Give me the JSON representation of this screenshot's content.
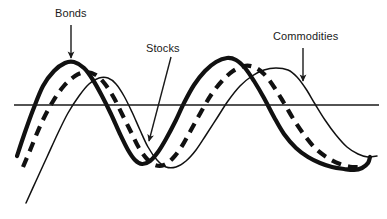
{
  "figure": {
    "background_color": "#ffffff",
    "line_color": "#111111",
    "axis_color": "#1a1a1a"
  },
  "annotations": [
    {
      "id": "bonds",
      "label": "Bonds",
      "points_to_series": "Bonds",
      "arrow": {
        "x1": 71,
        "y1": 25,
        "x2": 71,
        "y2": 58
      }
    },
    {
      "id": "stocks",
      "label": "Stocks",
      "points_to_series": "Stocks",
      "arrow": {
        "x1": 171,
        "y1": 57,
        "x2": 149,
        "y2": 141
      }
    },
    {
      "id": "commodities",
      "label": "Commodities",
      "points_to_series": "Commodities",
      "arrow": {
        "x1": 303,
        "y1": 48,
        "x2": 303,
        "y2": 81
      }
    }
  ],
  "chart_data": {
    "type": "line",
    "title": "",
    "xlabel": "",
    "ylabel": "",
    "grid": false,
    "legend_position": "inline-annotations",
    "axis": {
      "zero_line": true,
      "zero_line_y": 105,
      "zero_line_x_start": 14,
      "zero_line_x_end": 379,
      "xlim": [
        0,
        387
      ],
      "ylim": [
        219,
        0
      ]
    },
    "series": [
      {
        "name": "Bonds",
        "style": "thick-solid",
        "stroke_width": 4.2,
        "dash": "none",
        "color": "#111111",
        "phase_note": "leads — peaks first",
        "points": [
          [
            17,
            156
          ],
          [
            24,
            135
          ],
          [
            33,
            110
          ],
          [
            43,
            86
          ],
          [
            54,
            71
          ],
          [
            65,
            63
          ],
          [
            74,
            62
          ],
          [
            84,
            68
          ],
          [
            93,
            80
          ],
          [
            102,
            96
          ],
          [
            111,
            114
          ],
          [
            120,
            134
          ],
          [
            128,
            150
          ],
          [
            135,
            160
          ],
          [
            142,
            164
          ],
          [
            150,
            161
          ],
          [
            158,
            152
          ],
          [
            166,
            139
          ],
          [
            175,
            122
          ],
          [
            184,
            103
          ],
          [
            194,
            85
          ],
          [
            205,
            71
          ],
          [
            216,
            62
          ],
          [
            227,
            58
          ],
          [
            236,
            60
          ],
          [
            245,
            68
          ],
          [
            254,
            81
          ],
          [
            264,
            98
          ],
          [
            274,
            117
          ],
          [
            284,
            134
          ],
          [
            296,
            148
          ],
          [
            308,
            157
          ],
          [
            320,
            163
          ],
          [
            332,
            167
          ],
          [
            344,
            169
          ],
          [
            354,
            170
          ],
          [
            362,
            168
          ],
          [
            368,
            163
          ],
          [
            370,
            157
          ]
        ]
      },
      {
        "name": "Stocks",
        "style": "thick-dashed",
        "stroke_width": 4.2,
        "dash": "10 7",
        "color": "#111111",
        "phase_note": "lags Bonds by roughly a quarter cycle",
        "points": [
          [
            23,
            167
          ],
          [
            31,
            148
          ],
          [
            41,
            124
          ],
          [
            52,
            103
          ],
          [
            63,
            87
          ],
          [
            75,
            76
          ],
          [
            86,
            72
          ],
          [
            96,
            75
          ],
          [
            105,
            84
          ],
          [
            114,
            98
          ],
          [
            122,
            114
          ],
          [
            131,
            132
          ],
          [
            139,
            148
          ],
          [
            147,
            159
          ],
          [
            155,
            165
          ],
          [
            164,
            165
          ],
          [
            173,
            158
          ],
          [
            182,
            146
          ],
          [
            191,
            130
          ],
          [
            201,
            112
          ],
          [
            211,
            95
          ],
          [
            222,
            81
          ],
          [
            233,
            71
          ],
          [
            244,
            66
          ],
          [
            254,
            67
          ],
          [
            264,
            74
          ],
          [
            274,
            87
          ],
          [
            284,
            103
          ],
          [
            294,
            120
          ],
          [
            305,
            136
          ],
          [
            316,
            149
          ],
          [
            328,
            158
          ],
          [
            340,
            164
          ],
          [
            352,
            167
          ],
          [
            362,
            167
          ]
        ]
      },
      {
        "name": "Commodities",
        "style": "thin-solid",
        "stroke_width": 1.5,
        "dash": "none",
        "color": "#111111",
        "phase_note": "lags Stocks — peaks last",
        "points": [
          [
            26,
            203
          ],
          [
            36,
            181
          ],
          [
            47,
            157
          ],
          [
            58,
            133
          ],
          [
            68,
            113
          ],
          [
            79,
            96
          ],
          [
            89,
            84
          ],
          [
            99,
            78
          ],
          [
            108,
            78
          ],
          [
            116,
            84
          ],
          [
            124,
            96
          ],
          [
            132,
            112
          ],
          [
            140,
            130
          ],
          [
            148,
            147
          ],
          [
            157,
            160
          ],
          [
            166,
            167
          ],
          [
            176,
            167
          ],
          [
            186,
            161
          ],
          [
            196,
            150
          ],
          [
            206,
            135
          ],
          [
            217,
            118
          ],
          [
            228,
            101
          ],
          [
            240,
            86
          ],
          [
            252,
            76
          ],
          [
            264,
            70
          ],
          [
            276,
            68
          ],
          [
            288,
            70
          ],
          [
            297,
            77
          ],
          [
            306,
            89
          ],
          [
            315,
            104
          ],
          [
            325,
            120
          ],
          [
            336,
            135
          ],
          [
            347,
            147
          ],
          [
            358,
            154
          ],
          [
            368,
            157
          ],
          [
            377,
            156
          ]
        ]
      }
    ]
  }
}
